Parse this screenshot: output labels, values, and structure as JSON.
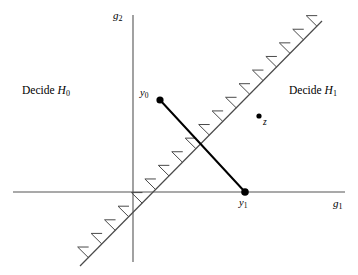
{
  "figure": {
    "background_color": "#ffffff",
    "width": 358,
    "height": 275
  },
  "axes": {
    "x_axis": {
      "label_text": "g",
      "label_sub": "1",
      "name": "g1",
      "color": "#555555",
      "x_start": 13,
      "x_end": 345,
      "y": 192
    },
    "y_axis": {
      "label_text": "g",
      "label_sub": "2",
      "name": "g2",
      "color": "#555555",
      "x": 133,
      "y_start": 15,
      "y_end": 262
    }
  },
  "regions": [
    {
      "id": "decide-h0",
      "prefix": "Decide ",
      "symbol": "H",
      "sub": "0",
      "x": 22,
      "y": 92
    },
    {
      "id": "decide-h1",
      "prefix": "Decide ",
      "symbol": "H",
      "sub": "1",
      "x": 292,
      "y": 92
    }
  ],
  "boundary": {
    "name": "decision-boundary",
    "color": "#4a4a4a",
    "stroke_width": 1.2,
    "x1": 80,
    "y1": 266,
    "x2": 322,
    "y2": 21,
    "hatch_count": 18,
    "hatch_length": 15,
    "hatch_cap": 11,
    "hatch_side": "upper-left"
  },
  "signal_line": {
    "name": "signal-connector",
    "color": "#000000",
    "stroke_width": 2.0,
    "x1": 160,
    "y1": 100,
    "x2": 245,
    "y2": 192
  },
  "points": [
    {
      "id": "y0",
      "symbol": "y",
      "sub": "0",
      "cx": 160,
      "cy": 100,
      "r": 3.6,
      "label_x": 140,
      "label_y": 90,
      "color": "#000000"
    },
    {
      "id": "y1",
      "symbol": "y",
      "sub": "1",
      "cx": 245,
      "cy": 192,
      "r": 3.8,
      "label_x": 238,
      "label_y": 198,
      "color": "#000000"
    },
    {
      "id": "z",
      "symbol": "z",
      "sub": "",
      "cx": 259,
      "cy": 116,
      "r": 2.6,
      "label_x": 263,
      "label_y": 120,
      "color": "#000000"
    }
  ]
}
